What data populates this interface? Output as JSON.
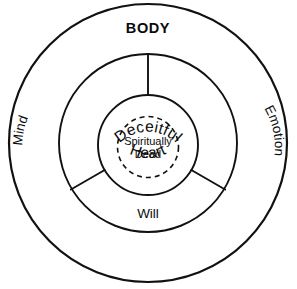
{
  "diagram": {
    "title": "BODY",
    "background_color": "#ffffff",
    "stroke_color": "#111111",
    "rings": [
      {
        "name": "body",
        "label": "BODY",
        "style": "solid",
        "radius": 140
      },
      {
        "name": "soul",
        "label": "",
        "style": "solid",
        "radius": 90
      },
      {
        "name": "heart",
        "label": "",
        "style": "solid",
        "radius": 50
      },
      {
        "name": "spirit",
        "label": "",
        "style": "dashed",
        "radius": 31
      }
    ],
    "segments": [
      {
        "name": "mind",
        "label": "Mind",
        "orientation": "arc-left"
      },
      {
        "name": "emotion",
        "label": "Emotion",
        "orientation": "arc-right"
      },
      {
        "name": "will",
        "label": "Will",
        "orientation": "horizontal"
      }
    ],
    "inner_circle": {
      "top_label": "Deceitful",
      "bottom_label": "Heart"
    },
    "core": {
      "line1": "Spiritually",
      "line2": "Dead"
    },
    "dividers": [
      {
        "name": "divider-top",
        "angle_deg": 90
      },
      {
        "name": "divider-lower-left",
        "angle_deg": 210
      },
      {
        "name": "divider-lower-right",
        "angle_deg": 330
      }
    ]
  }
}
